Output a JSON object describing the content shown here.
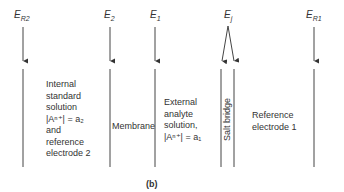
{
  "potentials": [
    {
      "id": "ER2",
      "main": "E",
      "sub": "R2"
    },
    {
      "id": "E2",
      "main": "E",
      "sub": "2"
    },
    {
      "id": "E1",
      "main": "E",
      "sub": "1"
    },
    {
      "id": "Ej",
      "main": "E",
      "sub": "j"
    },
    {
      "id": "ER1",
      "main": "E",
      "sub": "R1"
    }
  ],
  "regions": {
    "internal": [
      "Internal",
      "standard",
      "solution",
      "|Aⁿ⁺| = a₂",
      "and",
      "reference",
      "electrode 2"
    ],
    "membrane": "Membrane",
    "external": [
      "External",
      "analyte",
      "solution,",
      "|Aⁿ⁺| = a₁"
    ],
    "salt_bridge": "Salt bridge",
    "reference1": [
      "Reference",
      "electrode 1"
    ]
  },
  "caption": "(b)"
}
